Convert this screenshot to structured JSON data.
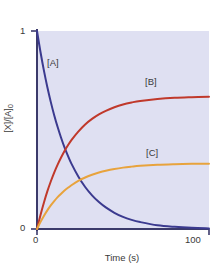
{
  "chart_data": {
    "type": "line",
    "title": "",
    "xlabel": "Time (s)",
    "ylabel": "[X]/[A]0",
    "ylabel_parts": {
      "num": "[X]",
      "slash": "/",
      "den": "[A]",
      "sub": "0"
    },
    "xlim": [
      0,
      100
    ],
    "ylim": [
      0,
      1
    ],
    "xticks": [
      0,
      100
    ],
    "xtick_labels": [
      "0",
      "100"
    ],
    "yticks": [
      0,
      1
    ],
    "ytick_labels": [
      "0",
      "1"
    ],
    "grid": false,
    "legend_position": "inline-annotations",
    "plot_background": "#dfe0f2",
    "frame_color": "#3b3a6b",
    "annotations": [
      {
        "text": "[A]",
        "x": 7,
        "y": 0.78
      },
      {
        "text": "[B]",
        "x": 65,
        "y": 0.87
      },
      {
        "text": "[C]",
        "x": 66,
        "y": 0.45
      }
    ],
    "series": [
      {
        "name": "[A]",
        "label": "[A]",
        "color": "#3b3a8f",
        "model": "exponential decay",
        "y0": 1.0,
        "plateau": 0.0,
        "x": [
          0,
          2,
          4,
          6,
          8,
          10,
          12,
          14,
          16,
          18,
          20,
          24,
          28,
          32,
          36,
          40,
          45,
          50,
          55,
          60,
          70,
          80,
          90,
          100
        ],
        "values": [
          1.0,
          0.895,
          0.801,
          0.717,
          0.642,
          0.575,
          0.515,
          0.461,
          0.412,
          0.369,
          0.33,
          0.265,
          0.212,
          0.17,
          0.136,
          0.109,
          0.082,
          0.061,
          0.046,
          0.035,
          0.019,
          0.011,
          0.006,
          0.003
        ]
      },
      {
        "name": "[B]",
        "label": "[B]",
        "color": "#c0392b",
        "model": "exponential rise",
        "y0": 0.0,
        "plateau": 0.67,
        "x": [
          0,
          2,
          4,
          6,
          8,
          10,
          12,
          14,
          16,
          18,
          20,
          24,
          28,
          32,
          36,
          40,
          45,
          50,
          55,
          60,
          70,
          80,
          90,
          100
        ],
        "values": [
          0.0,
          0.07,
          0.133,
          0.19,
          0.24,
          0.285,
          0.325,
          0.361,
          0.394,
          0.423,
          0.449,
          0.492,
          0.528,
          0.556,
          0.579,
          0.597,
          0.615,
          0.629,
          0.639,
          0.647,
          0.657,
          0.663,
          0.666,
          0.668
        ]
      },
      {
        "name": "[C]",
        "label": "[C]",
        "color": "#e8a33d",
        "model": "exponential rise",
        "y0": 0.0,
        "plateau": 0.33,
        "x": [
          0,
          2,
          4,
          6,
          8,
          10,
          12,
          14,
          16,
          18,
          20,
          24,
          28,
          32,
          36,
          40,
          45,
          50,
          55,
          60,
          70,
          80,
          90,
          100
        ],
        "values": [
          0.0,
          0.035,
          0.066,
          0.094,
          0.119,
          0.141,
          0.161,
          0.178,
          0.194,
          0.208,
          0.221,
          0.243,
          0.26,
          0.274,
          0.285,
          0.294,
          0.303,
          0.31,
          0.315,
          0.319,
          0.324,
          0.327,
          0.329,
          0.33
        ]
      }
    ]
  },
  "axes": {
    "x_title": "Time (s)",
    "x_min_label": "0",
    "x_max_label": "100",
    "y_max_label": "1",
    "y_min_label": "0"
  },
  "labels": {
    "a": "[A]",
    "b": "[B]",
    "c": "[C]"
  },
  "ylabel": {
    "numerator": "[X]",
    "slash": "/",
    "denominator": "[A]",
    "subscript": "0"
  }
}
